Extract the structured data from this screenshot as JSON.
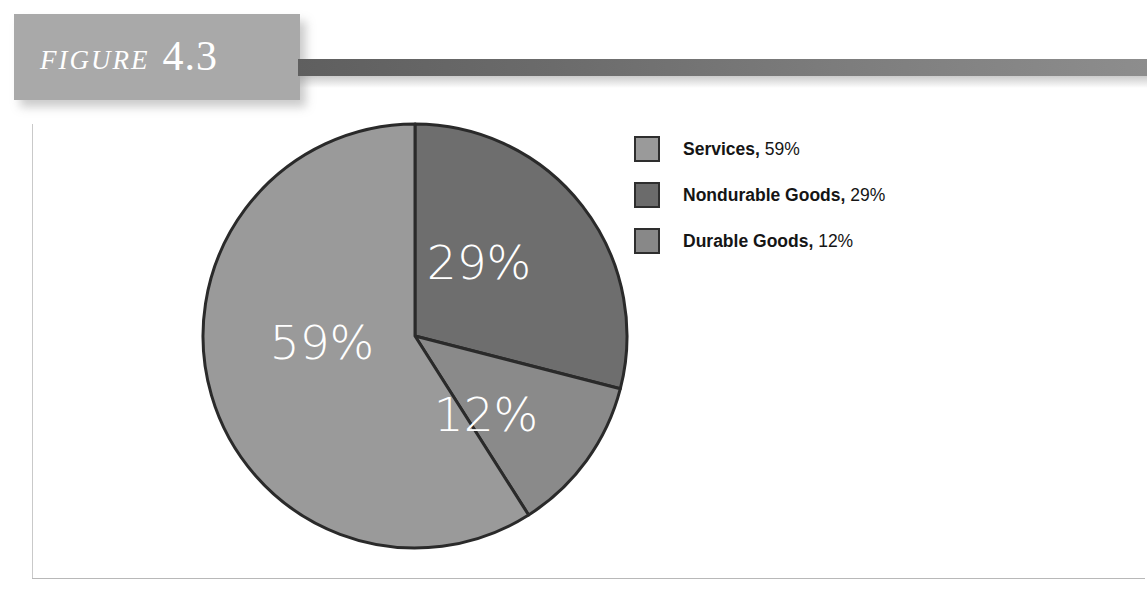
{
  "figure": {
    "label": "FIGURE",
    "number": "4.3"
  },
  "chart_data": {
    "type": "pie",
    "title": "",
    "subtitle": "",
    "xlabel": "",
    "ylabel": "",
    "legend_position": "right",
    "grid": false,
    "start_angle_deg": 0,
    "direction": "clockwise",
    "categories": [
      "Nondurable Goods",
      "Durable Goods",
      "Services"
    ],
    "values": [
      29,
      12,
      59
    ],
    "unit": "%",
    "slices": [
      {
        "name": "Nondurable Goods",
        "value": 29,
        "label": "29%",
        "color": "#6e6e6e",
        "start_deg": 0,
        "end_deg": 104.4
      },
      {
        "name": "Durable Goods",
        "value": 12,
        "label": "12%",
        "color": "#8a8a8a",
        "start_deg": 104.4,
        "end_deg": 147.6
      },
      {
        "name": "Services",
        "value": 59,
        "label": "59%",
        "color": "#9a9a9a",
        "start_deg": 147.6,
        "end_deg": 360
      }
    ],
    "legend": [
      {
        "label": "Services",
        "value": "59%",
        "color": "#9a9a9a"
      },
      {
        "label": "Nondurable Goods",
        "value": "29%",
        "color": "#6b6b6b"
      },
      {
        "label": "Durable Goods",
        "value": "12%",
        "color": "#888888"
      }
    ]
  },
  "legend_rows": [
    {
      "label": "Services,",
      "value": " 59%"
    },
    {
      "label": "Nondurable Goods,",
      "value": " 29%"
    },
    {
      "label": "Durable Goods,",
      "value": " 12%"
    }
  ],
  "slice_labels": {
    "nondurable": "29%",
    "durable": "12%",
    "services": "59%"
  },
  "colors": {
    "banner": "#a9a9a9",
    "tail_dark": "#5f5f5f",
    "slice_services": "#9a9a9a",
    "slice_nondurable": "#6e6e6e",
    "slice_durable": "#8a8a8a",
    "outline": "#2a2a2a",
    "label_text": "#ffffff"
  }
}
